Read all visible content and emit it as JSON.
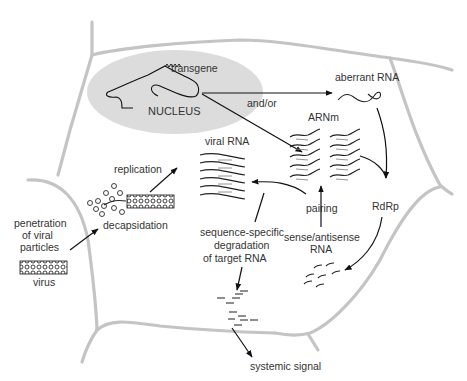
{
  "figure": {
    "type": "biological-pathway-diagram"
  },
  "labels": {
    "nucleus": "NUCLEUS",
    "transgene": "transgene",
    "and_or": "and/or",
    "aberrant_rna": "aberrant RNA",
    "arnm": "ARNm",
    "viral_rna": "viral RNA",
    "replication": "replication",
    "decapsidation": "decapsidation",
    "penetration_line1": "penetration",
    "penetration_line2": "of viral",
    "penetration_line3": "particles",
    "virus": "virus",
    "pairing": "pairing",
    "rdrp": "RdRp",
    "sense_antisense_line1": "sense/antisense",
    "sense_antisense_line2": "RNA",
    "degradation_line1": "sequence-specific",
    "degradation_line2": "degradation",
    "degradation_line3": "of target RNA",
    "systemic_signal": "systemic signal"
  },
  "colors": {
    "cell_wall": "#c4c4c4",
    "nucleus_fill": "#dcdcdc",
    "ink": "#111111",
    "text": "#333333"
  },
  "flows": [
    {
      "from": "virus",
      "to": "decapsidation"
    },
    {
      "from": "decapsidation",
      "to": "viral RNA",
      "label": "replication"
    },
    {
      "from": "NUCLEUS",
      "to": "aberrant RNA",
      "label": "and/or"
    },
    {
      "from": "NUCLEUS",
      "to": "ARNm"
    },
    {
      "from": "aberrant RNA",
      "to": "RdRp"
    },
    {
      "from": "ARNm",
      "to": "RdRp"
    },
    {
      "from": "RdRp",
      "to": "sense/antisense RNA"
    },
    {
      "from": "sense/antisense RNA",
      "to": "ARNm",
      "label": "pairing"
    },
    {
      "from": "pairing",
      "to": "viral RNA"
    },
    {
      "from": "viral RNA",
      "to": "fragments",
      "label": "sequence-specific degradation of target RNA"
    },
    {
      "from": "fragments",
      "to": "systemic signal"
    }
  ]
}
